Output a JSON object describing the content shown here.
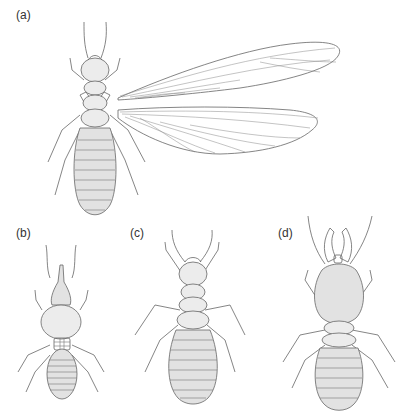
{
  "figure": {
    "panels": [
      {
        "id": "a",
        "label": "(a)",
        "subject": "winged alate (reproductive) termite"
      },
      {
        "id": "b",
        "label": "(b)",
        "subject": "nasute soldier termite"
      },
      {
        "id": "c",
        "label": "(c)",
        "subject": "worker termite"
      },
      {
        "id": "d",
        "label": "(d)",
        "subject": "mandibulate soldier termite"
      }
    ]
  }
}
